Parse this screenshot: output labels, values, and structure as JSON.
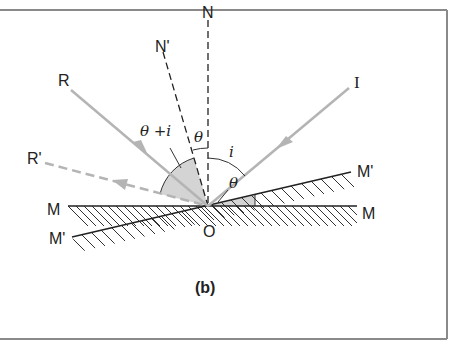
{
  "figure": {
    "caption": "(b)",
    "frame_color": "#8a8a8a",
    "ray_color": "#b4b4b4",
    "shade_color": "#d4d4d4",
    "line_color": "#222222"
  },
  "labels": {
    "normal": "N",
    "normal_rotated": "N'",
    "reflected": "R",
    "reflected_rotated": "R'",
    "incident": "I",
    "mirror_left": "M",
    "mirror_right": "M",
    "mirror_rotated_left": "M'",
    "mirror_rotated_right": "M'",
    "origin": "O"
  },
  "angles": {
    "theta_plus_i": "θ +i",
    "theta_top": "θ",
    "incidence": "i",
    "theta_mirror": "θ"
  }
}
